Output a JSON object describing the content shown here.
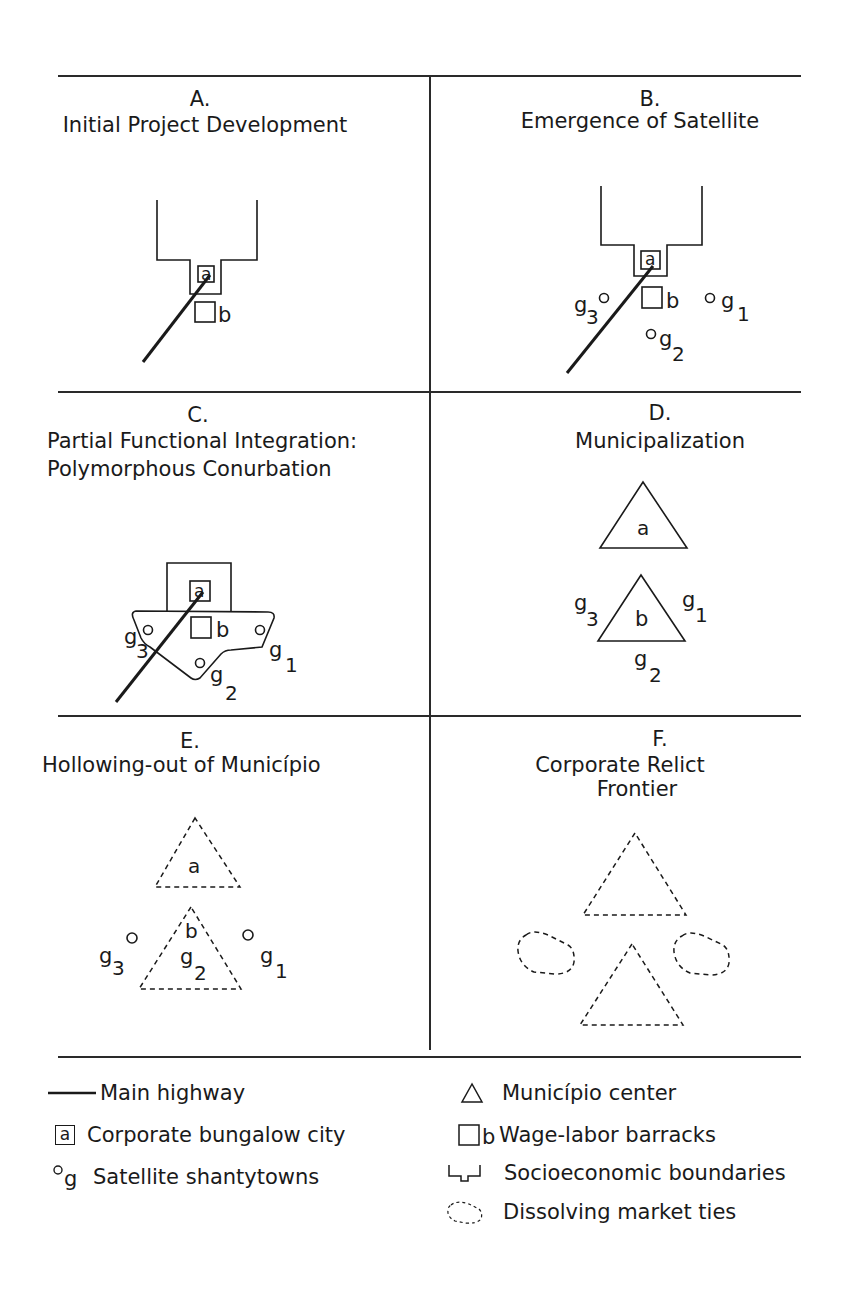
{
  "panels": {
    "A": {
      "letter": "A.",
      "title": "Initial Project Development"
    },
    "B": {
      "letter": "B.",
      "title": "Emergence of Satellite"
    },
    "C": {
      "letter": "C.",
      "title_line1": "Partial Functional Integration:",
      "title_line2": "Polymorphous Conurbation"
    },
    "D": {
      "letter": "D.",
      "title": "Municipalization"
    },
    "E": {
      "letter": "E.",
      "title": "Hollowing-out of Município"
    },
    "F": {
      "letter": "F.",
      "title_line1": "Corporate Relict",
      "title_line2": "Frontier"
    }
  },
  "labels": {
    "a": "a",
    "b": "b",
    "g": "g",
    "sub1": "1",
    "sub2": "2",
    "sub3": "3"
  },
  "legend": {
    "left": [
      {
        "symbol": "line-icon",
        "label": "Main highway"
      },
      {
        "symbol": "boxed-a-icon",
        "symbol_text": "a",
        "label": "Corporate bungalow city"
      },
      {
        "symbol": "circle-g-icon",
        "symbol_text": "g",
        "label": "Satellite shantytowns"
      }
    ],
    "right": [
      {
        "symbol": "triangle-icon",
        "label": "Município center"
      },
      {
        "symbol": "square-b-icon",
        "symbol_text": "b",
        "label": "Wage-labor barracks"
      },
      {
        "symbol": "boundary-icon",
        "label": "Socioeconomic boundaries"
      },
      {
        "symbol": "dashed-blob-icon",
        "label": "Dissolving market ties"
      }
    ]
  },
  "colors": {
    "ink": "#1a1a1a",
    "background": "#ffffff",
    "rule": "#2a2a2a"
  }
}
